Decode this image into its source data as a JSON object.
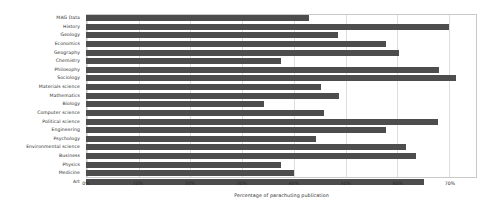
{
  "chart_data": {
    "type": "bar",
    "orientation": "horizontal",
    "title": "",
    "xlabel": "Percentage of parachuting publication",
    "ylabel": "",
    "xlim": [
      0,
      75.2
    ],
    "xticks": [
      0,
      10,
      20,
      30,
      40,
      50,
      60,
      70
    ],
    "xtick_labels": [
      "0%",
      "10%",
      "20%",
      "30%",
      "40%",
      "50%",
      "60%",
      "70%"
    ],
    "grid": true,
    "legend": false,
    "bar_color": "#4d4d4d",
    "categories": [
      "MAG Data",
      "History",
      "Geology",
      "Economics",
      "Geography",
      "Chemistry",
      "Philosophy",
      "Sociology",
      "Materials science",
      "Mathematics",
      "Biology",
      "Computer science",
      "Political science",
      "Engineering",
      "Psychology",
      "Environmental science",
      "Business",
      "Physics",
      "Medicine",
      "Art"
    ],
    "values": [
      42.9,
      69.8,
      48.5,
      57.7,
      60.2,
      37.5,
      67.9,
      71.2,
      45.2,
      48.7,
      34.2,
      45.8,
      67.7,
      57.7,
      44.2,
      61.5,
      63.5,
      37.5,
      40.0,
      65.0
    ]
  }
}
